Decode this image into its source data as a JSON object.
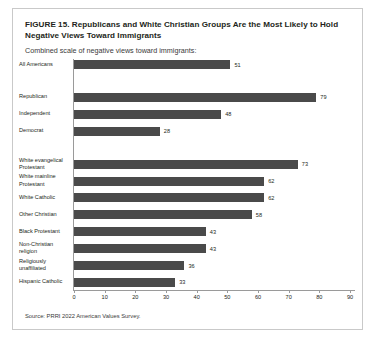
{
  "figure": {
    "title": "FIGURE 15.  Republicans and White Christian Groups Are the Most Likely to Hold Negative Views Toward Immigrants",
    "subtitle": "Combined scale of negative views toward immigrants:",
    "source": "Source: PRRI 2022 American Values Survey."
  },
  "chart_data": {
    "type": "bar",
    "orientation": "horizontal",
    "title": "FIGURE 15.  Republicans and White Christian Groups Are the Most Likely to Hold Negative Views Toward Immigrants",
    "subtitle": "Combined scale of negative views toward immigrants:",
    "xlabel": "",
    "ylabel": "",
    "xlim": [
      0,
      90
    ],
    "xticks": [
      0,
      10,
      20,
      30,
      40,
      50,
      60,
      70,
      80,
      90
    ],
    "grid": false,
    "legend": false,
    "bar_color": "#4a4a4a",
    "categories": [
      "All Americans",
      "Republican",
      "Independent",
      "Democrat",
      "White evangelical Protestant",
      "White mainline Protestant",
      "White Catholic",
      "Other Christian",
      "Black Protestant",
      "Non-Christian religion",
      "Religiously unaffiliated",
      "Hispanic Catholic"
    ],
    "values": [
      51,
      79,
      48,
      28,
      73,
      62,
      62,
      58,
      43,
      43,
      36,
      33
    ],
    "groups": [
      {
        "name": "overall",
        "categories": [
          "All Americans"
        ]
      },
      {
        "name": "party",
        "categories": [
          "Republican",
          "Independent",
          "Democrat"
        ]
      },
      {
        "name": "religion",
        "categories": [
          "White evangelical Protestant",
          "White mainline Protestant",
          "White Catholic",
          "Other Christian",
          "Black Protestant",
          "Non-Christian religion",
          "Religiously unaffiliated",
          "Hispanic Catholic"
        ]
      }
    ],
    "bars": [
      {
        "label": "All Americans",
        "label_lines": [
          "All Americans"
        ],
        "value": 51
      },
      {
        "label": "Republican",
        "label_lines": [
          "Republican"
        ],
        "value": 79
      },
      {
        "label": "Independent",
        "label_lines": [
          "Independent"
        ],
        "value": 48
      },
      {
        "label": "Democrat",
        "label_lines": [
          "Democrat"
        ],
        "value": 28
      },
      {
        "label": "White evangelical Protestant",
        "label_lines": [
          "White evangelical",
          "Protestant"
        ],
        "value": 73
      },
      {
        "label": "White mainline Protestant",
        "label_lines": [
          "White mainline",
          "Protestant"
        ],
        "value": 62
      },
      {
        "label": "White Catholic",
        "label_lines": [
          "White Catholic"
        ],
        "value": 62
      },
      {
        "label": "Other Christian",
        "label_lines": [
          "Other Christian"
        ],
        "value": 58
      },
      {
        "label": "Black Protestant",
        "label_lines": [
          "Black Protestant"
        ],
        "value": 43
      },
      {
        "label": "Non-Christian religion",
        "label_lines": [
          "Non-Christian",
          "religion"
        ],
        "value": 43
      },
      {
        "label": "Religiously unaffiliated",
        "label_lines": [
          "Religiously",
          "unaffiliated"
        ],
        "value": 36
      },
      {
        "label": "Hispanic Catholic",
        "label_lines": [
          "Hispanic Catholic"
        ],
        "value": 33
      }
    ]
  }
}
